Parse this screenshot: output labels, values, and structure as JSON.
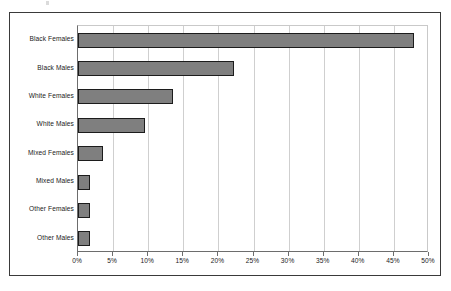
{
  "figure": {
    "background_color": "#ffffff",
    "frame_color": "#3a3a3a",
    "artifact_name": "scan-speck"
  },
  "chart_data": {
    "type": "bar",
    "orientation": "horizontal",
    "title": "",
    "subtitle": "",
    "xlabel": "",
    "ylabel": "",
    "categories": [
      "Black Females",
      "Black Males",
      "White Females",
      "White Males",
      "Mixed Females",
      "Mixed Males",
      "Other Females",
      "Other Males"
    ],
    "values": [
      47.9,
      22.2,
      13.5,
      9.5,
      3.5,
      1.7,
      1.7,
      1.7
    ],
    "value_unit": "%",
    "xlim": [
      0,
      50
    ],
    "xticks": [
      0,
      5,
      10,
      15,
      20,
      25,
      30,
      35,
      40,
      45,
      50
    ],
    "xtick_labels": [
      "0%",
      "5%",
      "10%",
      "15%",
      "20%",
      "25%",
      "30%",
      "35%",
      "40%",
      "45%",
      "50%"
    ],
    "grid": "vertical",
    "legend": "none",
    "series": [
      {
        "name": "",
        "bar_fill_color": "#7f7f7f",
        "bar_border_color": "#1c1c1c",
        "values": [
          47.9,
          22.2,
          13.5,
          9.5,
          3.5,
          1.7,
          1.7,
          1.7
        ]
      }
    ],
    "gridline_color": "#cfcfcf",
    "axis_color": "#6d6d6d"
  }
}
